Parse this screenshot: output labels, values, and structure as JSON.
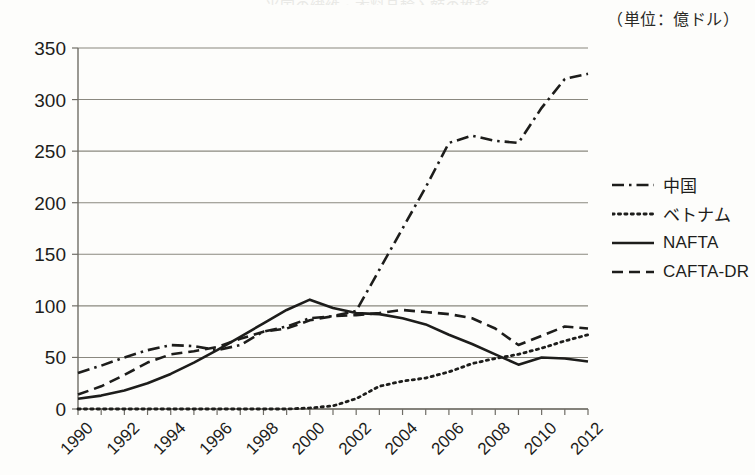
{
  "unit_note": "（単位：億ドル）",
  "title_clipped": "米国の繊維・衣料品輸入額の推移",
  "legend": {
    "position": "right",
    "items": [
      {
        "label": "中国",
        "style": "dash-dot",
        "key": "china"
      },
      {
        "label": "ベトナム",
        "style": "dotted",
        "key": "vietnam"
      },
      {
        "label": "NAFTA",
        "style": "solid",
        "key": "nafta"
      },
      {
        "label": "CAFTA-DR",
        "style": "dashed",
        "key": "cafta"
      }
    ]
  },
  "axes": {
    "y_ticks": [
      "0",
      "50",
      "100",
      "150",
      "200",
      "250",
      "300",
      "350"
    ],
    "x_ticks": [
      "1990",
      "1992",
      "1994",
      "1996",
      "1998",
      "2000",
      "2002",
      "2004",
      "2006",
      "2008",
      "2010",
      "2012"
    ]
  },
  "colors": {
    "line": "#1d1d1b",
    "grid": "#8a887f",
    "axis": "#6f6d66",
    "background": "#fdfdfb"
  },
  "chart_data": {
    "type": "line",
    "title": "米国の繊維・衣料品輸入額の推移",
    "subtitle": "（単位：億ドル）",
    "xlabel": "",
    "ylabel": "",
    "unit": "億ドル",
    "xlim": [
      1990,
      2012
    ],
    "ylim": [
      0,
      350
    ],
    "ytick_step": 50,
    "xtick_step": 2,
    "grid": true,
    "legend_position": "right",
    "x": [
      1990,
      1991,
      1992,
      1993,
      1994,
      1995,
      1996,
      1997,
      1998,
      1999,
      2000,
      2001,
      2002,
      2003,
      2004,
      2005,
      2006,
      2007,
      2008,
      2009,
      2010,
      2011,
      2012
    ],
    "series": [
      {
        "name": "中国",
        "key": "china",
        "style": "dash-dot",
        "values": [
          35,
          42,
          50,
          57,
          62,
          61,
          57,
          62,
          75,
          80,
          88,
          90,
          95,
          135,
          175,
          215,
          258,
          265,
          260,
          258,
          292,
          320,
          325
        ]
      },
      {
        "name": "ベトナム",
        "key": "vietnam",
        "style": "dotted",
        "values": [
          0,
          0,
          0,
          0,
          0,
          0,
          0,
          0,
          0,
          0,
          1,
          3,
          10,
          22,
          27,
          30,
          36,
          44,
          49,
          53,
          59,
          66,
          72
        ]
      },
      {
        "name": "NAFTA",
        "key": "nafta",
        "style": "solid",
        "values": [
          10,
          13,
          18,
          25,
          34,
          45,
          57,
          70,
          83,
          96,
          106,
          98,
          93,
          92,
          88,
          82,
          72,
          63,
          53,
          43,
          50,
          49,
          46
        ]
      },
      {
        "name": "CAFTA-DR",
        "key": "cafta",
        "style": "dashed",
        "values": [
          14,
          22,
          33,
          45,
          53,
          56,
          60,
          68,
          75,
          78,
          86,
          90,
          91,
          93,
          96,
          94,
          92,
          88,
          78,
          62,
          71,
          80,
          78
        ]
      }
    ]
  }
}
